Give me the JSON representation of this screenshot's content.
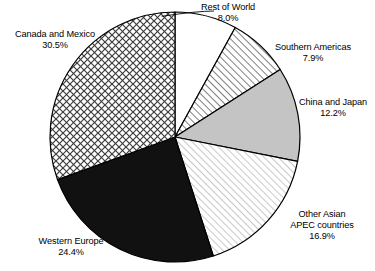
{
  "chart_data": {
    "type": "pie",
    "title": "",
    "subtitle": "",
    "xlabel": "",
    "ylabel": "",
    "legend_position": "none",
    "grid": false,
    "start_angle_deg": 0,
    "direction": "clockwise",
    "center": {
      "x": 175,
      "y": 137
    },
    "radius": 125,
    "categories": [
      "Rest of World",
      "Southern Americas",
      "China and Japan",
      "Other Asian APEC countries",
      "Western Europe",
      "Canada and Mexico"
    ],
    "values": [
      8.0,
      7.9,
      12.2,
      16.9,
      24.4,
      30.5
    ],
    "value_labels": [
      "8.0%",
      "7.9%",
      "12.2%",
      "16.9%",
      "24.4%",
      "30.5%"
    ],
    "slices": [
      {
        "name": "Rest of World",
        "value": 8.0,
        "value_label": "8.0%",
        "fill_style": "solid-white",
        "fill_color": "#ffffff",
        "stroke_color": "#000000"
      },
      {
        "name": "Southern Americas",
        "value": 7.9,
        "value_label": "7.9%",
        "fill_style": "diagonal-hatch-medium",
        "fill_color": "#ffffff",
        "stroke_color": "#000000"
      },
      {
        "name": "China and Japan",
        "value": 12.2,
        "value_label": "12.2%",
        "fill_style": "solid-gray",
        "fill_color": "#c4c4c4",
        "stroke_color": "#000000"
      },
      {
        "name": "Other Asian APEC countries",
        "value": 16.9,
        "value_label": "16.9%",
        "fill_style": "diagonal-hatch-light",
        "fill_color": "#ffffff",
        "stroke_color": "#000000"
      },
      {
        "name": "Western Europe",
        "value": 24.4,
        "value_label": "24.4%",
        "fill_style": "solid-black",
        "fill_color": "#111111",
        "stroke_color": "#000000"
      },
      {
        "name": "Canada and Mexico",
        "value": 30.5,
        "value_label": "30.5%",
        "fill_style": "crosshatch",
        "fill_color": "#ffffff",
        "stroke_color": "#000000"
      }
    ]
  },
  "labels": {
    "rest_of_world": {
      "line1": "Rest of World",
      "line2": "8.0%"
    },
    "southern_americas": {
      "line1": "Southern Americas",
      "line2": "7.9%"
    },
    "china_and_japan": {
      "line1": "China and Japan",
      "line2": "12.2%"
    },
    "other_asian_apec": {
      "line1": "Other Asian",
      "line2": "APEC countries",
      "line3": "16.9%"
    },
    "western_europe": {
      "line1": "Western Europe",
      "line2": "24.4%"
    },
    "canada_and_mexico": {
      "line1": "Canada and Mexico",
      "line2": "30.5%"
    }
  },
  "colors": {
    "background": "#ffffff",
    "outline": "#000000",
    "text": "#000000",
    "gray_slice": "#c4c4c4",
    "black_slice": "#111111"
  }
}
